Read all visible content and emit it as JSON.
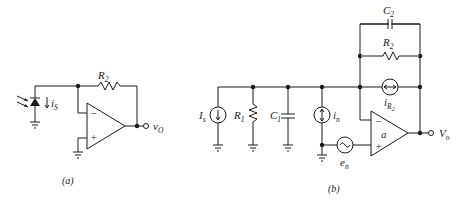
{
  "figure_a": {
    "caption": "(a)",
    "labels": {
      "R2": "R",
      "R2_sub": "2",
      "iS": "i",
      "iS_sub": "S",
      "vO": "v",
      "vO_sub": "O",
      "minus": "−",
      "plus": "+"
    }
  },
  "figure_b": {
    "caption": "(b)",
    "labels": {
      "C2": "C",
      "C2_sub": "2",
      "R2": "R",
      "R2_sub": "2",
      "iR2": "i",
      "iR2_sub": "R",
      "iR2_subsub": "2",
      "Is": "I",
      "Is_sub": "s",
      "R1": "R",
      "R1_sub": "1",
      "C1": "C",
      "C1_sub": "1",
      "in": "i",
      "in_sub": "n",
      "en": "e",
      "en_sub": "n",
      "a": "a",
      "Vo": "V",
      "Vo_sub": "o",
      "minus": "−",
      "plus": "+"
    }
  }
}
